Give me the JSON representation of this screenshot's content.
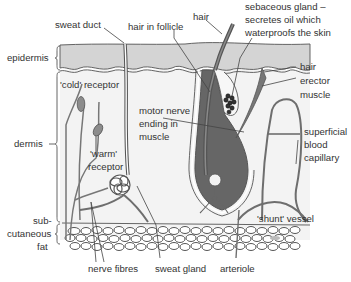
{
  "figure": {
    "layers": [
      {
        "id": "epidermis",
        "label": "epidermis",
        "color": "#d4d4d4"
      },
      {
        "id": "dermis",
        "label": "dermis",
        "color": "#f2f2f2"
      },
      {
        "id": "subcutaneous",
        "label_lines": [
          "sub-",
          "cutaneous",
          "fat"
        ],
        "color": "#ffffff"
      }
    ],
    "labels": {
      "sweat_duct": "sweat duct",
      "hair_in_follicle": "hair in follicle",
      "hair": "hair",
      "sebaceous_gland": [
        "sebaceous gland –",
        "secretes oil which",
        "waterproofs the skin"
      ],
      "epidermis": "epidermis",
      "cold_receptor": "'cold' receptor",
      "hair_erector_muscle": [
        "hair",
        "erector",
        "muscle"
      ],
      "motor_nerve": [
        "motor nerve",
        "ending in",
        "muscle"
      ],
      "dermis": "dermis",
      "warm_receptor": [
        "'warm'",
        "receptor"
      ],
      "superficial_capillary": [
        "superficial",
        "blood",
        "capillary"
      ],
      "subcutaneous_fat": [
        "sub-",
        "cutaneous",
        "fat"
      ],
      "shunt_vessel": "'shunt' vessel",
      "nerve_fibres": "nerve fibres",
      "sweat_gland": "sweat gland",
      "arteriole": "arteriole"
    },
    "colors": {
      "outline": "#555555",
      "epidermis": "#d4d4d4",
      "dermis": "#f3f3f3",
      "follicle": "#666666",
      "receptor": "#8c8c8c",
      "text": "#333333",
      "vessel": "#6e6e6e"
    }
  }
}
